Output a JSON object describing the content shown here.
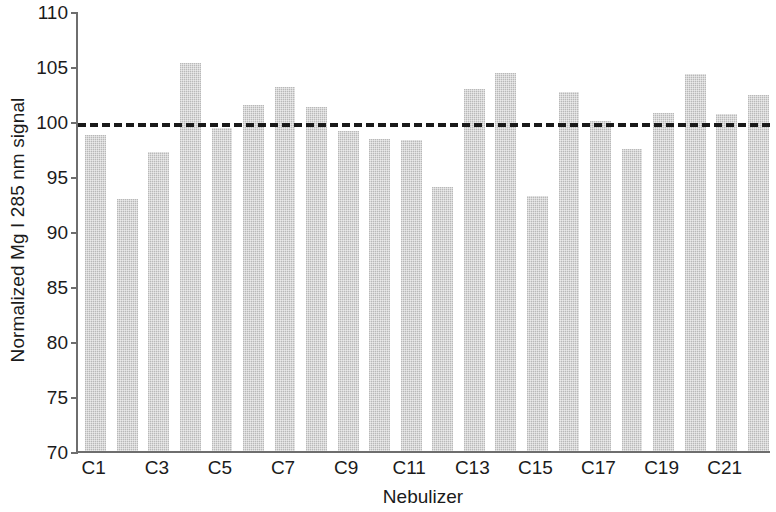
{
  "chart_data": {
    "type": "bar",
    "title": "",
    "xlabel": "Nebulizer",
    "ylabel": "Normalized Mg I 285 nm signal",
    "ylim": [
      70,
      110
    ],
    "ytick_values": [
      70,
      75,
      80,
      85,
      90,
      95,
      100,
      105,
      110
    ],
    "ytick_labels": [
      "70",
      "75",
      "80",
      "85",
      "90",
      "95",
      "100",
      "105",
      "110"
    ],
    "grid": false,
    "legend": null,
    "categories": [
      "C1",
      "C2",
      "C3",
      "C4",
      "C5",
      "C6",
      "C7",
      "C8",
      "C9",
      "C10",
      "C11",
      "C12",
      "C13",
      "C14",
      "C15",
      "C16",
      "C17",
      "C18",
      "C19",
      "C20",
      "C21",
      "C22"
    ],
    "xtick_labels": [
      "C1",
      "C3",
      "C5",
      "C7",
      "C9",
      "C11",
      "C13",
      "C15",
      "C17",
      "C19",
      "C21"
    ],
    "xtick_categories": [
      "C1",
      "C3",
      "C5",
      "C7",
      "C9",
      "C11",
      "C13",
      "C15",
      "C17",
      "C19",
      "C21"
    ],
    "values": [
      98.7,
      92.9,
      97.2,
      105.3,
      99.4,
      101.5,
      103.1,
      101.3,
      99.1,
      98.4,
      98.3,
      94.0,
      102.9,
      104.4,
      93.2,
      102.6,
      100.0,
      97.5,
      100.7,
      104.3,
      100.6,
      102.4
    ],
    "annotations": [
      {
        "name": "reference-line",
        "type": "hline",
        "value": 100,
        "style": "dashed",
        "color": "#1a1a1a"
      }
    ],
    "bar_color": "#c9c9c9",
    "axis_color": "#6e6e6e",
    "text_color": "#1b1b1b"
  }
}
